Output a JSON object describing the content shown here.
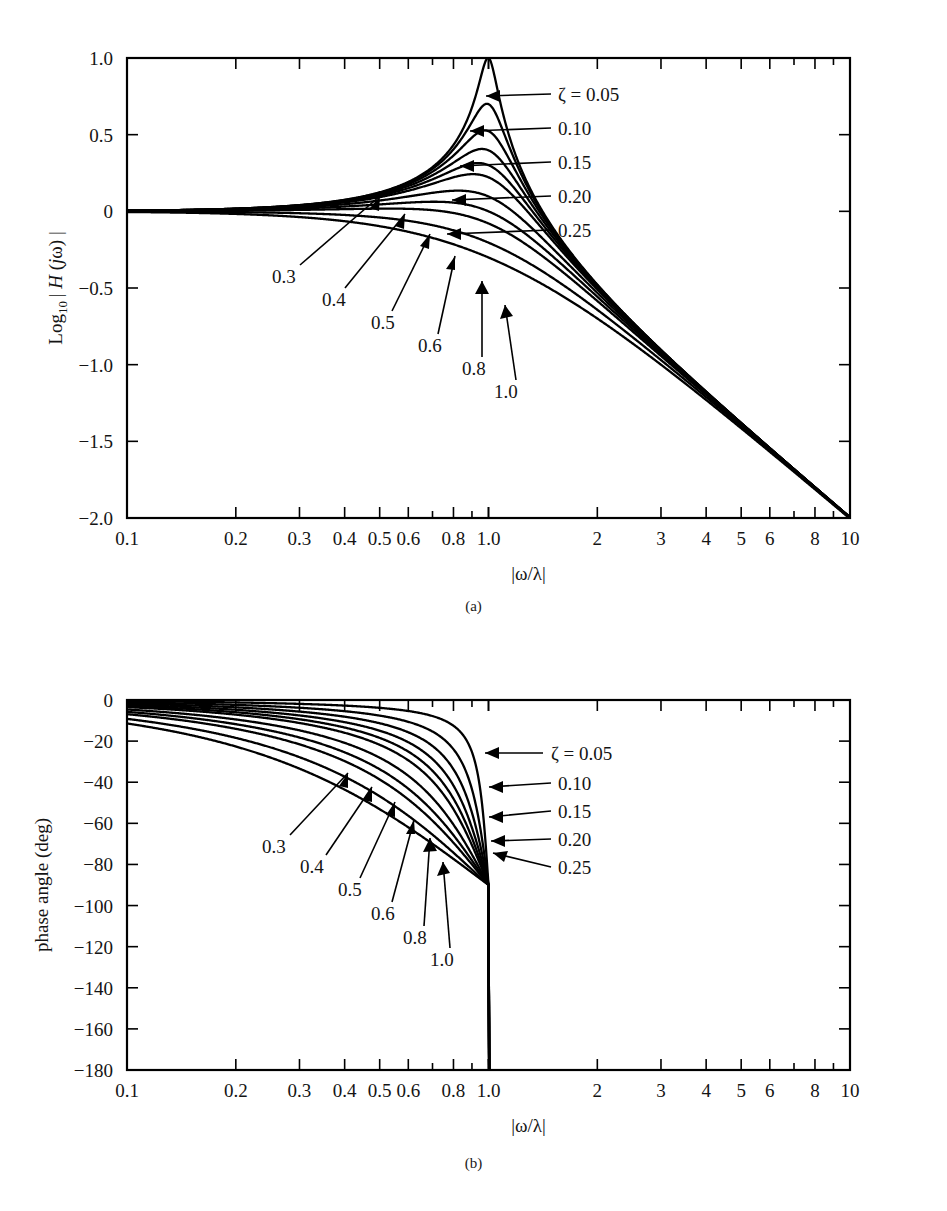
{
  "figure": {
    "panels": [
      {
        "id": "a",
        "caption": "(a)",
        "xlabel": "|ω/λ|",
        "ylabel_prefix": "Log",
        "ylabel_sub": "10",
        "ylabel_rest": "| H (jω) |",
        "ylabel_full": "Log10 | H (jω) |"
      },
      {
        "id": "b",
        "caption": "(b)",
        "xlabel": "|ω/λ|",
        "ylabel_full": "phase angle (deg)"
      }
    ]
  },
  "chart_data": [
    {
      "type": "line",
      "panel": "a",
      "title": "",
      "xlabel": "|ω/λ|",
      "ylabel": "Log10 | H (jω) |",
      "xscale": "log",
      "xlim": [
        0.1,
        10
      ],
      "ylim": [
        -2.0,
        1.0
      ],
      "grid": false,
      "legend_position": "inline-annotations",
      "xticks": [
        0.1,
        0.2,
        0.3,
        0.4,
        0.5,
        0.6,
        0.8,
        1.0,
        2,
        3,
        4,
        5,
        6,
        8,
        10
      ],
      "xticklabels": [
        "0.1",
        "0.2",
        "0.3",
        "0.4",
        "0.5",
        "0.6",
        "0.8",
        "1.0",
        "2",
        "3",
        "4",
        "5",
        "6",
        "8",
        "10"
      ],
      "yticks": [
        1.0,
        0.5,
        0,
        -0.5,
        -1.0,
        -1.5,
        -2.0
      ],
      "yticklabels": [
        "1.0",
        "0.5",
        "0",
        "-0.5",
        "-1.0",
        "-1.5",
        "-2.0"
      ],
      "series_parameter": "ζ",
      "series": [
        {
          "name": "0.05",
          "zeta": 0.05,
          "peak_value": 1.0,
          "peak_x": 1.0
        },
        {
          "name": "0.10",
          "zeta": 0.1,
          "peak_value": 0.7,
          "peak_x": 1.0
        },
        {
          "name": "0.15",
          "zeta": 0.15,
          "peak_value": 0.53,
          "peak_x": 1.0
        },
        {
          "name": "0.20",
          "zeta": 0.2,
          "peak_value": 0.41,
          "peak_x": 1.0
        },
        {
          "name": "0.25",
          "zeta": 0.25,
          "peak_value": 0.31,
          "peak_x": 0.97
        },
        {
          "name": "0.3",
          "zeta": 0.3,
          "peak_value": 0.24,
          "peak_x": 0.95
        },
        {
          "name": "0.4",
          "zeta": 0.4,
          "peak_value": 0.14,
          "peak_x": 0.9
        },
        {
          "name": "0.5",
          "zeta": 0.5,
          "peak_value": 0.06,
          "peak_x": 0.84
        },
        {
          "name": "0.6",
          "zeta": 0.6,
          "peak_value": 0.02,
          "peak_x": 0.76
        },
        {
          "name": "0.8",
          "zeta": 0.8,
          "peak_value": 0.0,
          "peak_x": 0.1
        },
        {
          "name": "1.0",
          "zeta": 1.0,
          "peak_value": 0.0,
          "peak_x": 0.1
        }
      ],
      "annotations": [
        {
          "text": "ζ = 0.05",
          "for": "0.05"
        },
        {
          "text": "0.10",
          "for": "0.10"
        },
        {
          "text": "0.15",
          "for": "0.15"
        },
        {
          "text": "0.20",
          "for": "0.20"
        },
        {
          "text": "0.25",
          "for": "0.25"
        },
        {
          "text": "0.3",
          "for": "0.3"
        },
        {
          "text": "0.4",
          "for": "0.4"
        },
        {
          "text": "0.5",
          "for": "0.5"
        },
        {
          "text": "0.6",
          "for": "0.6"
        },
        {
          "text": "0.8",
          "for": "0.8"
        },
        {
          "text": "1.0",
          "for": "1.0"
        }
      ]
    },
    {
      "type": "line",
      "panel": "b",
      "title": "",
      "xlabel": "|ω/λ|",
      "ylabel": "phase angle (deg)",
      "xscale": "log",
      "xlim": [
        0.1,
        10
      ],
      "ylim": [
        -180,
        0
      ],
      "grid": false,
      "legend_position": "inline-annotations",
      "xticks": [
        0.1,
        0.2,
        0.3,
        0.4,
        0.5,
        0.6,
        0.8,
        1.0,
        2,
        3,
        4,
        5,
        6,
        8,
        10
      ],
      "xticklabels": [
        "0.1",
        "0.2",
        "0.3",
        "0.4",
        "0.5",
        "0.6",
        "0.8",
        "1.0",
        "2",
        "3",
        "4",
        "5",
        "6",
        "8",
        "10"
      ],
      "yticks": [
        0,
        -20,
        -40,
        -60,
        -80,
        -100,
        -120,
        -140,
        -160,
        -180
      ],
      "yticklabels": [
        "0",
        "-20",
        "-40",
        "-60",
        "-80",
        "-100",
        "-120",
        "-140",
        "-160",
        "-180"
      ],
      "series_parameter": "ζ",
      "series": [
        {
          "name": "0.05",
          "zeta": 0.05,
          "value_at_1": -90
        },
        {
          "name": "0.10",
          "zeta": 0.1,
          "value_at_1": -90
        },
        {
          "name": "0.15",
          "zeta": 0.15,
          "value_at_1": -90
        },
        {
          "name": "0.20",
          "zeta": 0.2,
          "value_at_1": -90
        },
        {
          "name": "0.25",
          "zeta": 0.25,
          "value_at_1": -90
        },
        {
          "name": "0.3",
          "zeta": 0.3,
          "value_at_1": -90
        },
        {
          "name": "0.4",
          "zeta": 0.4,
          "value_at_1": -90
        },
        {
          "name": "0.5",
          "zeta": 0.5,
          "value_at_1": -90
        },
        {
          "name": "0.6",
          "zeta": 0.6,
          "value_at_1": -90
        },
        {
          "name": "0.8",
          "zeta": 0.8,
          "value_at_1": -90
        },
        {
          "name": "1.0",
          "zeta": 1.0,
          "value_at_1": -90
        }
      ],
      "annotations": [
        {
          "text": "ζ = 0.05",
          "for": "0.05"
        },
        {
          "text": "0.10",
          "for": "0.10"
        },
        {
          "text": "0.15",
          "for": "0.15"
        },
        {
          "text": "0.20",
          "for": "0.20"
        },
        {
          "text": "0.25",
          "for": "0.25"
        },
        {
          "text": "0.3",
          "for": "0.3"
        },
        {
          "text": "0.4",
          "for": "0.4"
        },
        {
          "text": "0.5",
          "for": "0.5"
        },
        {
          "text": "0.6",
          "for": "0.6"
        },
        {
          "text": "0.8",
          "for": "0.8"
        },
        {
          "text": "1.0",
          "for": "1.0"
        }
      ]
    }
  ],
  "style": {
    "curve_color": "#000000",
    "axis_color": "#000000",
    "background": "#ffffff"
  }
}
